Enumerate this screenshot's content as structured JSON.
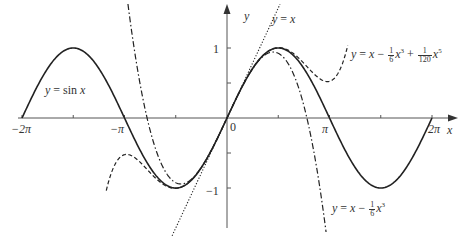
{
  "chart_data": {
    "type": "line",
    "title": "",
    "xlabel": "x",
    "ylabel": "y",
    "xlim": [
      -6.6,
      6.8
    ],
    "ylim": [
      -1.75,
      1.7
    ],
    "x_ticks": [
      {
        "value": -6.2832,
        "label": "−2π"
      },
      {
        "value": -4.7124,
        "label": ""
      },
      {
        "value": -3.1416,
        "label": "−π"
      },
      {
        "value": -1.5708,
        "label": ""
      },
      {
        "value": 0,
        "label": "0"
      },
      {
        "value": 1.5708,
        "label": ""
      },
      {
        "value": 3.1416,
        "label": "π"
      },
      {
        "value": 4.7124,
        "label": ""
      },
      {
        "value": 6.2832,
        "label": "2π"
      }
    ],
    "y_ticks": [
      {
        "value": 1,
        "label": "1"
      },
      {
        "value": 0.5,
        "label": ""
      },
      {
        "value": -0.5,
        "label": ""
      },
      {
        "value": -1,
        "label": "−1"
      }
    ],
    "grid": false,
    "series": [
      {
        "name": "y = sin x",
        "style": "solid",
        "function": "sin(x)",
        "domain": [
          -6.2832,
          6.2832
        ]
      },
      {
        "name": "y = x",
        "style": "dotted",
        "function": "x",
        "domain": [
          -1.7,
          1.7
        ]
      },
      {
        "name": "y = x − (1/6)x³",
        "style": "dashdot",
        "function": "x - x^3/6",
        "domain": [
          -3.3,
          3.3
        ]
      },
      {
        "name": "y = x − (1/6)x³ + (1/120)x⁵",
        "style": "dashed",
        "function": "x - x^3/6 + x^5/120",
        "domain": [
          -3.7,
          3.7
        ]
      }
    ]
  },
  "labels": {
    "axis_y": "y",
    "axis_x": "x",
    "origin": "0",
    "tick_y_pos": "1",
    "tick_y_neg": "−1",
    "tick_x_neg2pi": "−2π",
    "tick_x_negpi": "−π",
    "tick_x_pi": "π",
    "tick_x_2pi": "2π",
    "sin_label_lhs": "y",
    "sin_label_eq": " = sin ",
    "sin_label_var": "x",
    "linear_lhs": "y",
    "linear_eq": " = ",
    "linear_var": "x",
    "cubic_lhs": "y",
    "cubic_eq": " = ",
    "cubic_x": "x",
    "cubic_minus": " − ",
    "cubic_frac_num": "1",
    "cubic_frac_den": "6",
    "cubic_x3": "x",
    "cubic_exp": "3",
    "quintic_lhs": "y",
    "quintic_eq": " = ",
    "quintic_x": "x",
    "quintic_minus": " − ",
    "quintic_frac1_num": "1",
    "quintic_frac1_den": "6",
    "quintic_x3": "x",
    "quintic_exp3": "3",
    "quintic_plus": " + ",
    "quintic_frac2_num": "1",
    "quintic_frac2_den": "120",
    "quintic_x5": "x",
    "quintic_exp5": "5"
  }
}
